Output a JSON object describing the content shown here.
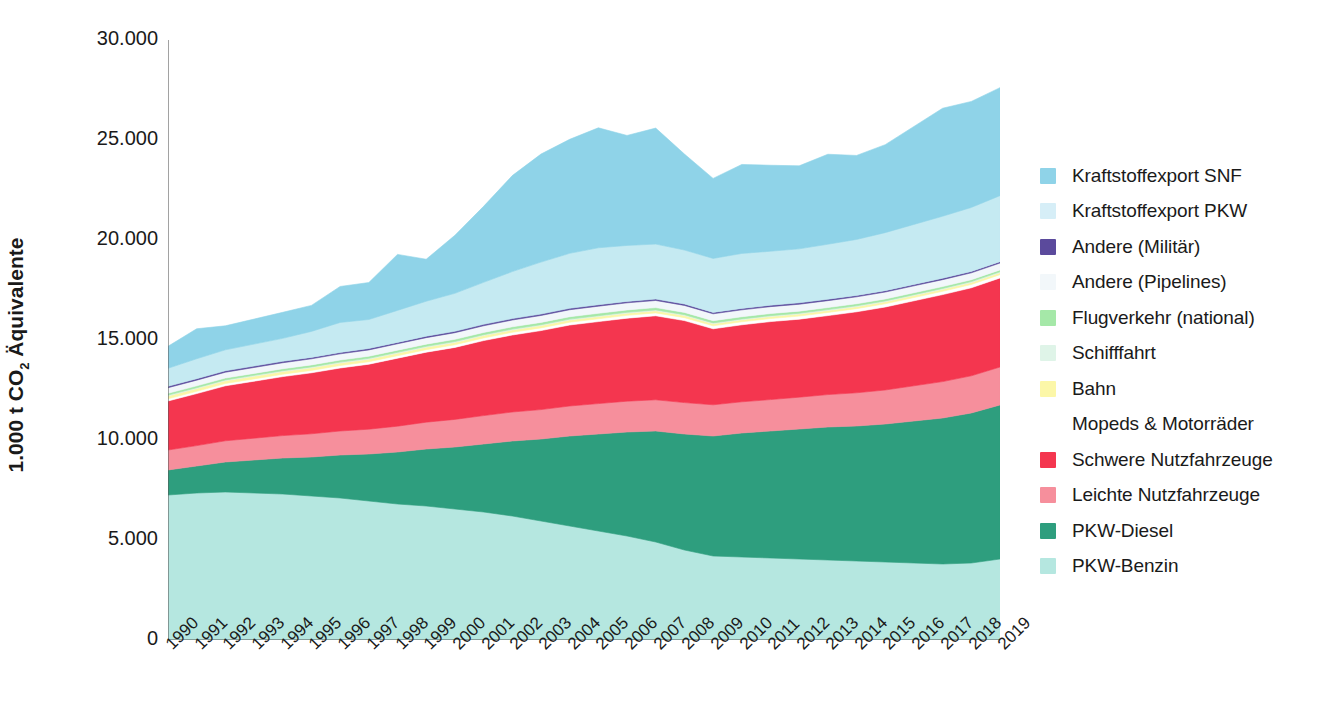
{
  "chart_data": {
    "type": "area",
    "stacked": true,
    "title": "",
    "subtitle": "",
    "xlabel": "",
    "ylabel": "1.000 t CO2 Äquivalente",
    "ylabel_parts": {
      "pre": "1.000 t CO",
      "sub": "2",
      "post": " Äquivalente"
    },
    "ylim": [
      0,
      30000
    ],
    "yticks": [
      0,
      5000,
      10000,
      15000,
      20000,
      25000,
      30000
    ],
    "ytick_labels": [
      "0",
      "5.000",
      "10.000",
      "15.000",
      "20.000",
      "25.000",
      "30.000"
    ],
    "grid": false,
    "legend_position": "right",
    "categories": [
      "1990",
      "1991",
      "1992",
      "1993",
      "1994",
      "1995",
      "1996",
      "1997",
      "1998",
      "1999",
      "2000",
      "2001",
      "2002",
      "2003",
      "2004",
      "2005",
      "2006",
      "2007",
      "2008",
      "2009",
      "2010",
      "2011",
      "2012",
      "2013",
      "2014",
      "2015",
      "2016",
      "2017",
      "2018",
      "2019"
    ],
    "series": [
      {
        "name": "PKW-Benzin",
        "color": "#b5e7e0",
        "values": [
          7250,
          7350,
          7400,
          7350,
          7300,
          7200,
          7100,
          6950,
          6800,
          6700,
          6550,
          6400,
          6200,
          5950,
          5700,
          5450,
          5200,
          4900,
          4500,
          4200,
          4150,
          4100,
          4050,
          4000,
          3950,
          3900,
          3850,
          3800,
          3850,
          4050
        ]
      },
      {
        "name": "PKW-Diesel",
        "color": "#2e9e7e",
        "values": [
          1250,
          1350,
          1500,
          1650,
          1800,
          1950,
          2150,
          2350,
          2600,
          2850,
          3100,
          3400,
          3750,
          4100,
          4500,
          4850,
          5200,
          5550,
          5800,
          6000,
          6200,
          6350,
          6500,
          6650,
          6750,
          6900,
          7100,
          7300,
          7500,
          7700
        ]
      },
      {
        "name": "Leichte Nutzfahrzeuge",
        "color": "#f68f9c",
        "values": [
          1000,
          1020,
          1060,
          1090,
          1120,
          1160,
          1200,
          1240,
          1290,
          1340,
          1380,
          1420,
          1450,
          1470,
          1500,
          1520,
          1540,
          1560,
          1570,
          1560,
          1560,
          1570,
          1590,
          1620,
          1660,
          1700,
          1760,
          1820,
          1860,
          1900
        ]
      },
      {
        "name": "Schwere Nutzfahrzeuge",
        "color": "#f4364f",
        "values": [
          2450,
          2600,
          2750,
          2850,
          2950,
          3050,
          3150,
          3250,
          3400,
          3500,
          3600,
          3750,
          3850,
          3950,
          4050,
          4100,
          4150,
          4200,
          4100,
          3800,
          3850,
          3900,
          3900,
          3950,
          4050,
          4150,
          4250,
          4350,
          4400,
          4450
        ]
      },
      {
        "name": "Mopeds & Motorräder",
        "color": "#ffffff",
        "values": [
          110,
          112,
          114,
          116,
          118,
          120,
          122,
          124,
          126,
          128,
          130,
          132,
          134,
          136,
          138,
          140,
          142,
          144,
          146,
          148,
          150,
          152,
          154,
          156,
          158,
          160,
          162,
          164,
          166,
          168
        ]
      },
      {
        "name": "Bahn",
        "color": "#fcf7a8",
        "values": [
          140,
          138,
          136,
          134,
          132,
          130,
          128,
          126,
          124,
          122,
          120,
          118,
          116,
          114,
          112,
          110,
          108,
          106,
          104,
          102,
          100,
          100,
          100,
          100,
          100,
          100,
          100,
          100,
          100,
          100
        ]
      },
      {
        "name": "Schifffahrt",
        "color": "#dff4e8",
        "values": [
          45,
          45,
          45,
          45,
          45,
          45,
          45,
          45,
          45,
          45,
          45,
          45,
          45,
          45,
          45,
          45,
          45,
          45,
          45,
          45,
          45,
          45,
          45,
          45,
          45,
          45,
          45,
          45,
          45,
          45
        ]
      },
      {
        "name": "Flugverkehr (national)",
        "color": "#a5e8a8",
        "values": [
          90,
          92,
          94,
          96,
          98,
          100,
          102,
          104,
          106,
          108,
          110,
          112,
          114,
          116,
          118,
          120,
          118,
          116,
          114,
          110,
          108,
          106,
          104,
          102,
          100,
          98,
          96,
          94,
          92,
          90
        ]
      },
      {
        "name": "Andere (Pipelines)",
        "color": "#f2f7fa",
        "values": [
          280,
          285,
          290,
          295,
          300,
          305,
          310,
          315,
          320,
          325,
          330,
          335,
          340,
          345,
          350,
          355,
          355,
          355,
          350,
          345,
          345,
          345,
          345,
          345,
          345,
          345,
          345,
          345,
          345,
          345
        ]
      },
      {
        "name": "Andere (Militär)",
        "color": "#5b4a9c",
        "values": [
          70,
          70,
          70,
          70,
          70,
          70,
          70,
          70,
          70,
          70,
          70,
          70,
          70,
          70,
          70,
          70,
          70,
          70,
          70,
          70,
          70,
          70,
          70,
          70,
          70,
          70,
          70,
          70,
          70,
          70
        ]
      },
      {
        "name": "Kraftstoffexport PKW",
        "color": "#c5eaf2",
        "values": [
          900,
          1000,
          1050,
          1100,
          1150,
          1300,
          1500,
          1450,
          1600,
          1750,
          1900,
          2100,
          2350,
          2600,
          2750,
          2850,
          2800,
          2750,
          2700,
          2700,
          2750,
          2700,
          2700,
          2750,
          2800,
          2900,
          3000,
          3100,
          3200,
          3300
        ]
      },
      {
        "name": "Kraftstoffexport SNF",
        "color": "#8fd3e8",
        "values": [
          1100,
          1500,
          1200,
          1250,
          1300,
          1300,
          1800,
          1850,
          2800,
          2100,
          2900,
          3800,
          4800,
          5400,
          5700,
          6000,
          5500,
          5800,
          4800,
          4000,
          4450,
          4300,
          4150,
          4500,
          4200,
          4400,
          4900,
          5400,
          5300,
          5400
        ]
      }
    ],
    "legend_order": [
      "Kraftstoffexport SNF",
      "Kraftstoffexport PKW",
      "Andere (Militär)",
      "Andere (Pipelines)",
      "Flugverkehr (national)",
      "Schifffahrt",
      "Bahn",
      "Mopeds & Motorräder",
      "Schwere Nutzfahrzeuge",
      "Leichte Nutzfahrzeuge",
      "PKW-Diesel",
      "PKW-Benzin"
    ]
  },
  "legend": {
    "items": [
      {
        "label": "Kraftstoffexport SNF",
        "color": "#8fd3e8"
      },
      {
        "label": "Kraftstoffexport PKW",
        "color": "#d6eef7"
      },
      {
        "label": "Andere (Militär)",
        "color": "#5b4a9c"
      },
      {
        "label": "Andere (Pipelines)",
        "color": "#f2f7fa"
      },
      {
        "label": "Flugverkehr (national)",
        "color": "#a5e8a8"
      },
      {
        "label": "Schifffahrt",
        "color": "#dff4e8"
      },
      {
        "label": "Bahn",
        "color": "#fcf7a8"
      },
      {
        "label": "Mopeds & Motorräder",
        "color": "#ffffff"
      },
      {
        "label": "Schwere Nutzfahrzeuge",
        "color": "#f4364f"
      },
      {
        "label": "Leichte Nutzfahrzeuge",
        "color": "#f68f9c"
      },
      {
        "label": "PKW-Diesel",
        "color": "#2e9e7e"
      },
      {
        "label": "PKW-Benzin",
        "color": "#b5e7e0"
      }
    ]
  },
  "axis": {
    "y_title_pre": "1.000 t CO",
    "y_title_sub": "2",
    "y_title_post": " Äquivalente"
  }
}
